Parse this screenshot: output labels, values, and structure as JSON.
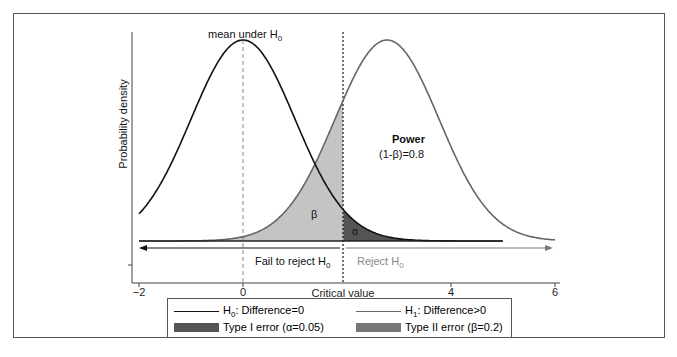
{
  "chart_data": {
    "type": "area",
    "title": "",
    "xlabel": "",
    "ylabel": "Probability density",
    "xlim": [
      -2,
      6
    ],
    "x_ticks": [
      -2,
      0,
      4,
      6
    ],
    "x_tick_labels": [
      "-2",
      "0",
      "4",
      "6"
    ],
    "critical_value_label": "Critical value",
    "critical_value": 1.93,
    "grid": false,
    "series": [
      {
        "name": "H0: Difference=0",
        "distribution": "normal",
        "mean": 0,
        "sd": 1,
        "color": "#111111"
      },
      {
        "name": "H1: Difference>0",
        "distribution": "normal",
        "mean": 2.77,
        "sd": 1,
        "color": "#666666"
      }
    ],
    "shaded_regions": [
      {
        "name": "Type I error (α=0.05)",
        "label": "α",
        "under": "H0",
        "from": 1.93,
        "to": 6,
        "color": "#555555"
      },
      {
        "name": "Type II error (β=0.2)",
        "label": "β",
        "under": "H1",
        "from": -2,
        "to": 1.93,
        "color": "#bdbdbd"
      }
    ],
    "annotations": [
      {
        "text": "mean under H0",
        "x": 0
      },
      {
        "text": "Power",
        "subtext": "(1-β)=0.8"
      },
      {
        "text": "Fail to reject H0",
        "region": "left"
      },
      {
        "text": "Reject H0",
        "region": "right"
      }
    ],
    "legend_position": "bottom"
  },
  "labels": {
    "ylabel": "Probability density",
    "mean_under": "mean under H",
    "mean_sub": "0",
    "power": "Power",
    "power_value": "(1-β)=0.8",
    "beta": "β",
    "alpha": "α",
    "fail_reject": "Fail to reject H",
    "fail_sub": "0",
    "reject": "Reject H",
    "reject_sub": "0",
    "critical_value": "Critical value",
    "ticks": [
      "−2",
      "0",
      "4",
      "6"
    ]
  },
  "legend": {
    "h0_pre": "H",
    "h0_sub": "0",
    "h0_post": ": Difference=0",
    "h1_pre": "H",
    "h1_sub": "1",
    "h1_post": ": Difference>0",
    "type1": "Type I error (α=0.05)",
    "type2": "Type II error (β=0.2)"
  }
}
